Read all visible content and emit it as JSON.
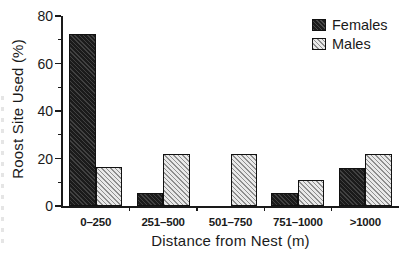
{
  "chart_data": {
    "type": "bar",
    "title": "",
    "xlabel": "Distance from Nest (m)",
    "ylabel": "Roost Site Used (%)",
    "categories": [
      "0–250",
      "251–500",
      "501–750",
      "751–1000",
      ">1000"
    ],
    "series": [
      {
        "name": "Females",
        "values": [
          72.5,
          5.5,
          0,
          5.5,
          16
        ],
        "color": "#1b1b1b",
        "pattern": "dark-diagonal-hatch"
      },
      {
        "name": "Males",
        "values": [
          16.5,
          22,
          22,
          11,
          22
        ],
        "color": "#d6d6d6",
        "pattern": "light-diagonal-hatch"
      }
    ],
    "ylim": [
      0,
      80
    ],
    "yticks": [
      0,
      20,
      40,
      60,
      80
    ],
    "ytick_labels": [
      "0",
      "20",
      "40",
      "60",
      "80"
    ],
    "yminor_ticks": [
      10,
      30,
      50,
      70
    ],
    "grid": false,
    "legend_position": "top-right",
    "legend_entries": [
      "Females",
      "Males"
    ]
  },
  "legend": {
    "items": [
      {
        "label": "Females"
      },
      {
        "label": "Males"
      }
    ]
  },
  "axes": {
    "y_title": "Roost Site Used (%)",
    "x_title": "Distance from Nest (m)"
  }
}
